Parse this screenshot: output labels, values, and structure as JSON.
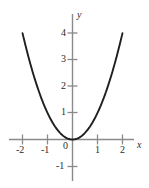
{
  "figure": {
    "background_color": "#ffffff",
    "axis_color": "#8a8a8a",
    "curve_color": "#1f1f1f",
    "text_color": "#2b2b2b"
  },
  "chart_data": {
    "type": "line",
    "title": "",
    "subtitle": "",
    "xlabel": "x",
    "ylabel": "y",
    "function": "y = x^2",
    "grid": false,
    "legend": null,
    "xlim": [
      -2.5,
      2.5
    ],
    "ylim": [
      -1.5,
      4.6
    ],
    "xticks": [
      -2,
      -1,
      1,
      2
    ],
    "xtick_labels": [
      "-2",
      "-1",
      "1",
      "2"
    ],
    "yticks": [
      -1,
      1,
      2,
      3,
      4
    ],
    "ytick_labels": [
      "-1",
      "1",
      "2",
      "3",
      "4"
    ],
    "origin_label": "0",
    "x": [
      -2,
      -1.8,
      -1.6,
      -1.4,
      -1.2,
      -1,
      -0.8,
      -0.6,
      -0.4,
      -0.2,
      0,
      0.2,
      0.4,
      0.6,
      0.8,
      1,
      1.2,
      1.4,
      1.6,
      1.8,
      2
    ],
    "y": [
      4,
      3.24,
      2.56,
      1.96,
      1.44,
      1,
      0.64,
      0.36,
      0.16,
      0.04,
      0,
      0.04,
      0.16,
      0.36,
      0.64,
      1,
      1.44,
      1.96,
      2.56,
      3.24,
      4
    ]
  },
  "labels": {
    "x_axis_name": "x",
    "y_axis_name": "y",
    "origin": "0",
    "x_neg2": "-2",
    "x_neg1": "-1",
    "x_pos1": "1",
    "x_pos2": "2",
    "y_neg1": "-1",
    "y_1": "1",
    "y_2": "2",
    "y_3": "3",
    "y_4": "4"
  }
}
